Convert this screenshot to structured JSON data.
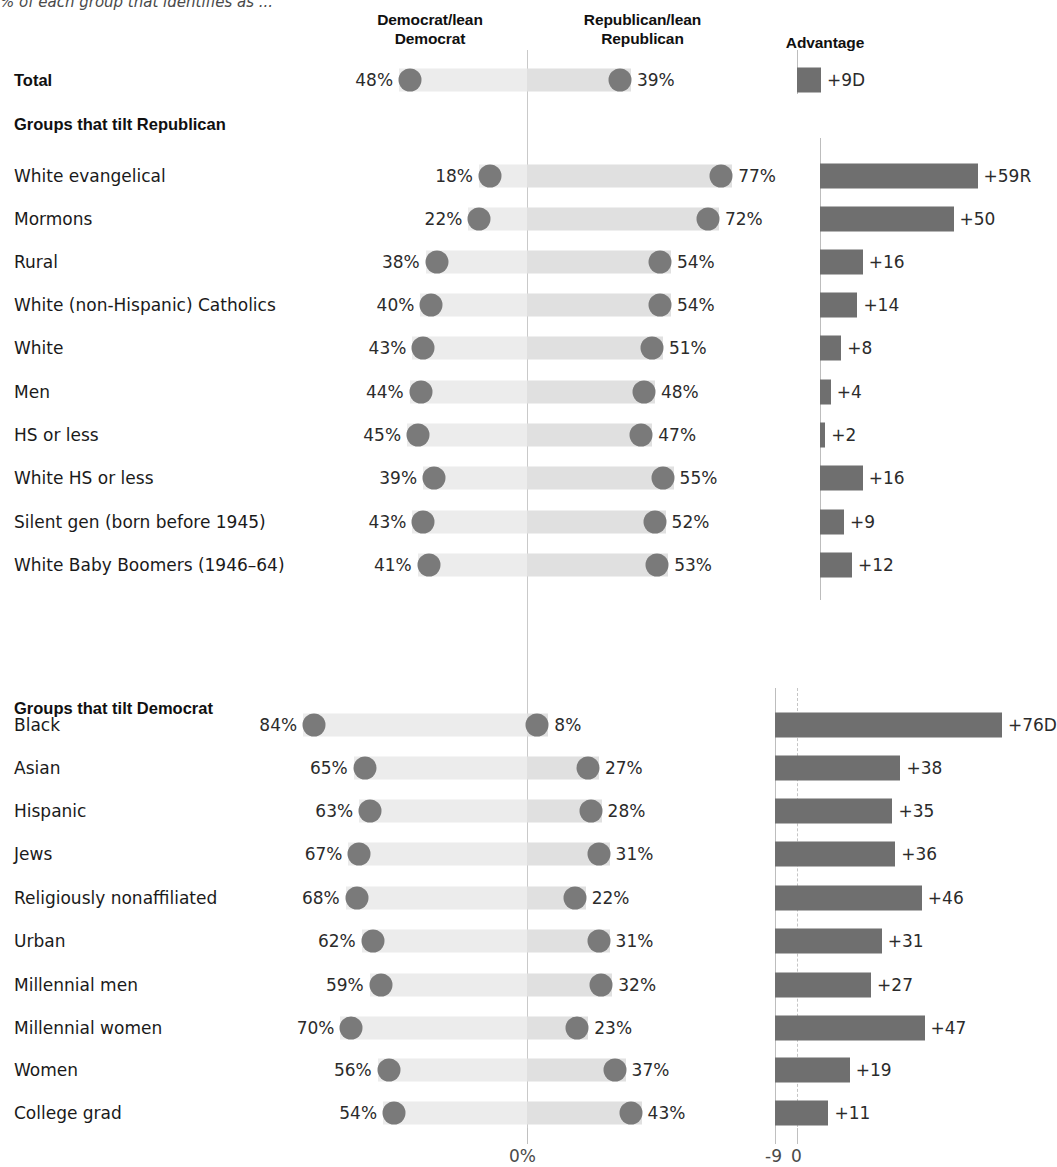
{
  "subtitle": "% of each group that identifies as ...",
  "headers": {
    "democrat": "Democrat/lean\nDemocrat",
    "democrat_line1": "Democrat/lean",
    "democrat_line2": "Democrat",
    "republican_line1": "Republican/lean",
    "republican_line2": "Republican",
    "advantage": "Advantage"
  },
  "sections": {
    "republican_heading": "Groups that tilt Republican",
    "democrat_heading": "Groups that tilt Democrat"
  },
  "axis": {
    "center_label": "0%",
    "adv_neg9_label": "-9",
    "adv_zero_label": "0"
  },
  "colors": {
    "dot": "#7a7a7a",
    "bar_dem": "#ececec",
    "bar_rep": "#e0e0e0",
    "adv_bar": "#6f6f6f",
    "gridline": "#c9c9c9",
    "text": "#1a1a1a"
  },
  "chart_data": {
    "type": "bar",
    "subtitle": "% of each group that identifies as ...",
    "series_names": [
      "Democrat/lean Democrat",
      "Republican/lean Republican",
      "Advantage"
    ],
    "xlabel": "",
    "ylabel": "",
    "xlim_main": [
      0,
      100
    ],
    "xlim_advantage": [
      -9,
      80
    ],
    "grid": false,
    "legend": "column-headers",
    "rows": [
      {
        "label": "Total",
        "kind": "total",
        "dem": 48,
        "rep": 39,
        "dem_label": "48%",
        "rep_label": "39%",
        "advantage": 9,
        "advantage_label": "+9D",
        "adv_side": "D"
      },
      {
        "label": "Groups that tilt Republican",
        "kind": "section"
      },
      {
        "label": "White evangelical",
        "kind": "data",
        "group": "republican",
        "dem": 18,
        "rep": 77,
        "dem_label": "18%",
        "rep_label": "77%",
        "advantage": 59,
        "advantage_label": "+59R",
        "adv_side": "R"
      },
      {
        "label": "Mormons",
        "kind": "data",
        "group": "republican",
        "dem": 22,
        "rep": 72,
        "dem_label": "22%",
        "rep_label": "72%",
        "advantage": 50,
        "advantage_label": "+50",
        "adv_side": "R"
      },
      {
        "label": "Rural",
        "kind": "data",
        "group": "republican",
        "dem": 38,
        "rep": 54,
        "dem_label": "38%",
        "rep_label": "54%",
        "advantage": 16,
        "advantage_label": "+16",
        "adv_side": "R"
      },
      {
        "label": "White (non-Hispanic) Catholics",
        "kind": "data",
        "group": "republican",
        "dem": 40,
        "rep": 54,
        "dem_label": "40%",
        "rep_label": "54%",
        "advantage": 14,
        "advantage_label": "+14",
        "adv_side": "R"
      },
      {
        "label": "White",
        "kind": "data",
        "group": "republican",
        "dem": 43,
        "rep": 51,
        "dem_label": "43%",
        "rep_label": "51%",
        "advantage": 8,
        "advantage_label": "+8",
        "adv_side": "R"
      },
      {
        "label": "Men",
        "kind": "data",
        "group": "republican",
        "dem": 44,
        "rep": 48,
        "dem_label": "44%",
        "rep_label": "48%",
        "advantage": 4,
        "advantage_label": "+4",
        "adv_side": "R"
      },
      {
        "label": "HS or less",
        "kind": "data",
        "group": "republican",
        "dem": 45,
        "rep": 47,
        "dem_label": "45%",
        "rep_label": "47%",
        "advantage": 2,
        "advantage_label": "+2",
        "adv_side": "R"
      },
      {
        "label": "White HS or less",
        "kind": "data",
        "group": "republican",
        "dem": 39,
        "rep": 55,
        "dem_label": "39%",
        "rep_label": "55%",
        "advantage": 16,
        "advantage_label": "+16",
        "adv_side": "R"
      },
      {
        "label": "Silent gen (born before 1945)",
        "kind": "data",
        "group": "republican",
        "dem": 43,
        "rep": 52,
        "dem_label": "43%",
        "rep_label": "52%",
        "advantage": 9,
        "advantage_label": "+9",
        "adv_side": "R"
      },
      {
        "label": "White Baby Boomers (1946–64)",
        "kind": "data",
        "group": "republican",
        "dem": 41,
        "rep": 53,
        "dem_label": "41%",
        "rep_label": "53%",
        "advantage": 12,
        "advantage_label": "+12",
        "adv_side": "R"
      },
      {
        "label": "Groups that tilt Democrat",
        "kind": "section"
      },
      {
        "label": "Black",
        "kind": "data",
        "group": "democrat",
        "dem": 84,
        "rep": 8,
        "dem_label": "84%",
        "rep_label": "8%",
        "advantage": 76,
        "advantage_label": "+76D",
        "adv_side": "D"
      },
      {
        "label": "Asian",
        "kind": "data",
        "group": "democrat",
        "dem": 65,
        "rep": 27,
        "dem_label": "65%",
        "rep_label": "27%",
        "advantage": 38,
        "advantage_label": "+38",
        "adv_side": "D"
      },
      {
        "label": "Hispanic",
        "kind": "data",
        "group": "democrat",
        "dem": 63,
        "rep": 28,
        "dem_label": "63%",
        "rep_label": "28%",
        "advantage": 35,
        "advantage_label": "+35",
        "adv_side": "D"
      },
      {
        "label": "Jews",
        "kind": "data",
        "group": "democrat",
        "dem": 67,
        "rep": 31,
        "dem_label": "67%",
        "rep_label": "31%",
        "advantage": 36,
        "advantage_label": "+36",
        "adv_side": "D"
      },
      {
        "label": "Religiously nonaffiliated",
        "kind": "data",
        "group": "democrat",
        "dem": 68,
        "rep": 22,
        "dem_label": "68%",
        "rep_label": "22%",
        "advantage": 46,
        "advantage_label": "+46",
        "adv_side": "D"
      },
      {
        "label": "Urban",
        "kind": "data",
        "group": "democrat",
        "dem": 62,
        "rep": 31,
        "dem_label": "62%",
        "rep_label": "31%",
        "advantage": 31,
        "advantage_label": "+31",
        "adv_side": "D"
      },
      {
        "label": "Millennial men",
        "kind": "data",
        "group": "democrat",
        "dem": 59,
        "rep": 32,
        "dem_label": "59%",
        "rep_label": "32%",
        "advantage": 27,
        "advantage_label": "+27",
        "adv_side": "D"
      },
      {
        "label": "Millennial women",
        "kind": "data",
        "group": "democrat",
        "dem": 70,
        "rep": 23,
        "dem_label": "70%",
        "rep_label": "23%",
        "advantage": 47,
        "advantage_label": "+47",
        "adv_side": "D"
      },
      {
        "label": "Women",
        "kind": "data",
        "group": "democrat",
        "dem": 56,
        "rep": 37,
        "dem_label": "56%",
        "rep_label": "37%",
        "advantage": 19,
        "advantage_label": "+19",
        "adv_side": "D"
      },
      {
        "label": "College grad",
        "kind": "data",
        "group": "democrat",
        "dem": 54,
        "rep": 43,
        "dem_label": "54%",
        "rep_label": "43%",
        "advantage": 11,
        "advantage_label": "+11",
        "adv_side": "D"
      }
    ]
  }
}
